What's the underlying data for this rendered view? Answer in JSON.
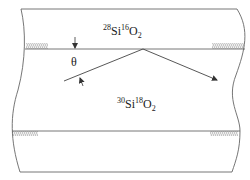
{
  "diagram": {
    "type": "thin-film reflection schematic",
    "layers": [
      {
        "name": "top-layer",
        "label": {
          "mass1": "28",
          "element1": "Si",
          "mass2": "16",
          "element2": "O",
          "subscript": "2"
        }
      },
      {
        "name": "bottom-layer",
        "label": {
          "mass1": "30",
          "element1": "Si",
          "mass2": "18",
          "element2": "O",
          "subscript": "2"
        }
      }
    ],
    "angle_label": "θ",
    "colors": {
      "line": "#555555",
      "text": "#1a1a1a",
      "background": "#ffffff"
    }
  }
}
